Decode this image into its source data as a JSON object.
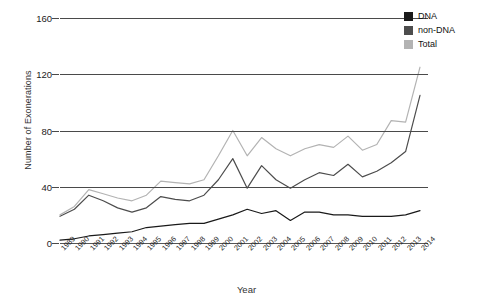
{
  "chart_data": {
    "type": "line",
    "title": "",
    "xlabel": "Year",
    "ylabel": "Number of Exonerations",
    "ylim": [
      0,
      160
    ],
    "yticks": [
      0,
      40,
      80,
      120,
      160
    ],
    "grid": true,
    "legend_position": "top-right",
    "categories": [
      "1989",
      "1990",
      "1991",
      "1992",
      "1993",
      "1994",
      "1995",
      "1996",
      "1997",
      "1998",
      "1999",
      "2000",
      "2001",
      "2002",
      "2003",
      "2004",
      "2005",
      "2006",
      "2007",
      "2008",
      "2009",
      "2010",
      "2011",
      "2012",
      "2013",
      "2014"
    ],
    "series": [
      {
        "name": "DNA",
        "color": "#1a1a1a",
        "values": [
          2,
          3,
          5,
          6,
          7,
          8,
          11,
          12,
          13,
          14,
          14,
          17,
          20,
          24,
          21,
          23,
          16,
          22,
          22,
          20,
          20,
          19,
          19,
          19,
          20,
          23
        ]
      },
      {
        "name": "non-DNA",
        "color": "#4d4d4d",
        "values": [
          19,
          24,
          34,
          30,
          25,
          22,
          25,
          33,
          31,
          30,
          34,
          45,
          60,
          39,
          55,
          45,
          39,
          45,
          50,
          48,
          56,
          47,
          51,
          57,
          65,
          105
        ]
      },
      {
        "name": "Total",
        "color": "#b3b3b3",
        "values": [
          20,
          26,
          38,
          35,
          32,
          30,
          34,
          44,
          43,
          42,
          45,
          62,
          80,
          62,
          75,
          67,
          62,
          67,
          70,
          68,
          76,
          66,
          70,
          87,
          86,
          125
        ]
      }
    ]
  },
  "legend": {
    "items": [
      {
        "label": "DNA",
        "color": "#1a1a1a"
      },
      {
        "label": "non-DNA",
        "color": "#4d4d4d"
      },
      {
        "label": "Total",
        "color": "#b3b3b3"
      }
    ]
  }
}
